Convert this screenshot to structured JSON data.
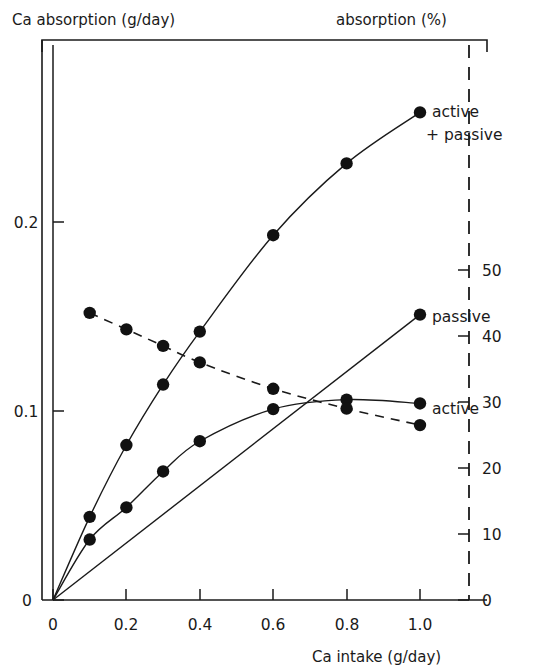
{
  "chart_data": {
    "type": "line",
    "title": "",
    "xlabel": "Ca intake (g/day)",
    "ylabel": "Ca absorption (g/day)",
    "y2label": "absorption (%)",
    "xlim": [
      0,
      1.12
    ],
    "ylim": [
      0,
      0.2857
    ],
    "y2lim": [
      0,
      57.14
    ],
    "grid": false,
    "legend_position": "inline-right-of-curves",
    "xticks": [
      0,
      0.2,
      0.4,
      0.6,
      0.8,
      1.0
    ],
    "xticklabels": [
      "0",
      "0.2",
      "0.4",
      "0.6",
      "0.8",
      "1.0"
    ],
    "yticks": [
      0,
      0.1,
      0.2
    ],
    "yticklabels": [
      "0",
      "0.1",
      "0.2"
    ],
    "y2ticks": [
      0,
      10,
      20,
      30,
      40,
      50
    ],
    "y2ticklabels": [
      "0",
      "10",
      "20",
      "30",
      "40",
      "50"
    ],
    "series": [
      {
        "name": "active + passive",
        "label": "active\n+ passive",
        "style": "solid",
        "marker": "filled-circle",
        "axis": "left",
        "x": [
          0,
          0.1,
          0.2,
          0.3,
          0.4,
          0.6,
          0.8,
          1.0
        ],
        "values": [
          0,
          0.044,
          0.082,
          0.114,
          0.142,
          0.193,
          0.231,
          0.258
        ]
      },
      {
        "name": "active",
        "label": "active",
        "style": "solid",
        "marker": "filled-circle",
        "axis": "left",
        "x": [
          0,
          0.1,
          0.2,
          0.3,
          0.4,
          0.6,
          0.8,
          1.0
        ],
        "values": [
          0,
          0.032,
          0.049,
          0.068,
          0.084,
          0.101,
          0.106,
          0.104
        ]
      },
      {
        "name": "passive",
        "label": "passive",
        "style": "solid",
        "marker": "filled-circle",
        "axis": "left",
        "x": [
          0,
          1.0
        ],
        "values": [
          0,
          0.151
        ]
      },
      {
        "name": "absorption percentage",
        "label": "",
        "style": "dashed",
        "marker": "filled-circle",
        "axis": "right",
        "x": [
          0.1,
          0.2,
          0.3,
          0.4,
          0.6,
          0.8,
          1.0
        ],
        "values": [
          43.5,
          41.0,
          38.5,
          36.0,
          32.0,
          29.0,
          26.5
        ]
      }
    ],
    "annotations": [
      {
        "text": "active",
        "x": 1.0,
        "y": 0.258,
        "placement": "right-of-point"
      },
      {
        "text": "+ passive",
        "x": 1.0,
        "y": 0.242,
        "placement": "below-active"
      },
      {
        "text": "passive",
        "x": 1.0,
        "y": 0.151,
        "placement": "right-of-point"
      },
      {
        "text": "active",
        "x": 1.0,
        "y": 0.106,
        "placement": "right-of-point"
      }
    ]
  },
  "labels": {
    "y_axis_title": "Ca absorption (g/day)",
    "y2_axis_title": "absorption (%)",
    "x_axis_title": "Ca intake (g/day)",
    "series_active_passive_line1": "active",
    "series_active_passive_line2": "+ passive",
    "series_passive": "passive",
    "series_active": "active"
  },
  "ticks": {
    "x": [
      "0",
      "0.2",
      "0.4",
      "0.6",
      "0.8",
      "1.0"
    ],
    "y_left": [
      "0",
      "0.1",
      "0.2"
    ],
    "y_right": [
      "0",
      "10",
      "20",
      "30",
      "40",
      "50"
    ]
  },
  "colors": {
    "ink": "#1a1a1a",
    "marker": "#111111",
    "background": "#ffffff"
  }
}
